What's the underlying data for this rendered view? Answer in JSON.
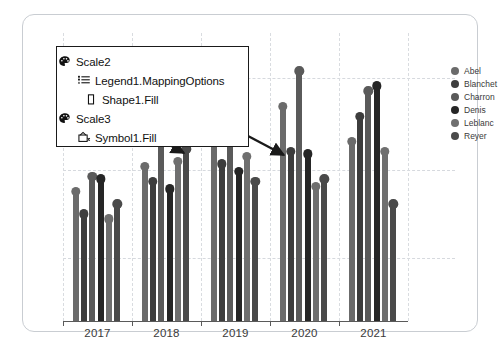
{
  "callout": {
    "rows": [
      {
        "icon": "palette-icon",
        "label": "Scale2",
        "indent": 0
      },
      {
        "icon": "mapping-options-icon",
        "label": "Legend1.MappingOptions",
        "indent": 1
      },
      {
        "icon": "shape-rect-icon",
        "label": "Shape1.Fill",
        "indent": 2
      },
      {
        "icon": "palette-icon",
        "label": "Scale3",
        "indent": 0
      },
      {
        "icon": "symbol-icon",
        "label": "Symbol1.Fill",
        "indent": 1
      }
    ]
  },
  "legend": {
    "title": "",
    "items": [
      {
        "label": "Abel",
        "color": "#6b6b6b"
      },
      {
        "label": "Blanchet",
        "color": "#3d3d3d"
      },
      {
        "label": "Charron",
        "color": "#5a5a5a"
      },
      {
        "label": "Denis",
        "color": "#262626"
      },
      {
        "label": "Leblanc",
        "color": "#6f6f6f"
      },
      {
        "label": "Reyer",
        "color": "#4a4a4a"
      }
    ]
  },
  "chart_data": {
    "type": "bar",
    "title": "",
    "xlabel": "",
    "ylabel": "",
    "grid": true,
    "legend_position": "right",
    "categories": [
      "2017",
      "2018",
      "2019",
      "2020",
      "2021"
    ],
    "series": [
      {
        "name": "Abel",
        "color": "#6b6b6b",
        "values": [
          52,
          62,
          76,
          86,
          72
        ]
      },
      {
        "name": "Blanchet",
        "color": "#3d3d3d",
        "values": [
          43,
          56,
          63,
          68,
          82
        ]
      },
      {
        "name": "Charron",
        "color": "#5a5a5a",
        "values": [
          58,
          72,
          84,
          100,
          92
        ]
      },
      {
        "name": "Denis",
        "color": "#262626",
        "values": [
          57,
          53,
          60,
          67,
          94
        ]
      },
      {
        "name": "Leblanc",
        "color": "#6f6f6f",
        "values": [
          41,
          64,
          66,
          54,
          68
        ]
      },
      {
        "name": "Reyer",
        "color": "#4a4a4a",
        "values": [
          47,
          69,
          56,
          57,
          47
        ]
      }
    ],
    "ylim": [
      0,
      110
    ],
    "gridlines_y": [
      25,
      60,
      97
    ]
  },
  "colors": {
    "card_border": "#c9cdd2",
    "grid": "#d6d9de",
    "axis": "#5a5a5a",
    "callout_border": "#1a1a1a",
    "arrow": "#1a1a1a",
    "text": "#3a3a3a"
  }
}
